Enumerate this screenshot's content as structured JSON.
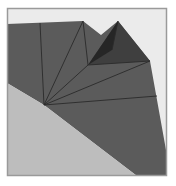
{
  "diagram": {
    "type": "triangulated-polygon-render",
    "size": [
      176,
      186
    ],
    "frame": {
      "x": 7,
      "y": 8,
      "width": 160,
      "height": 168,
      "fill": "#ebebeb",
      "stroke": "#9a9a9a"
    },
    "colors": {
      "surface": "#5b5b5b",
      "wedge": "#bdbdbd",
      "spike_light": "#3f3f3f",
      "spike_dark": "#262626",
      "edge": "#2a2a2a"
    },
    "shapes": {
      "surface": "7,24 83,21 101,35 118,21 150,61 166,150 166,176 137,176 44,105 7,83",
      "wedge": "7,83 44,105 137,176 7,176",
      "spike_light": "88,65 118,21 150,61",
      "spike_dark": "88,65 118,21 112,50"
    },
    "hub": [
      44,
      105
    ],
    "fan_targets": [
      [
        40,
        23
      ],
      [
        83,
        21
      ],
      [
        88,
        65
      ],
      [
        150,
        61
      ],
      [
        157,
        96
      ]
    ],
    "extra_edges": [
      [
        [
          83,
          21
        ],
        [
          88,
          65
        ]
      ],
      [
        [
          88,
          65
        ],
        [
          150,
          61
        ]
      ],
      [
        [
          118,
          21
        ],
        [
          112,
          50
        ]
      ]
    ]
  }
}
